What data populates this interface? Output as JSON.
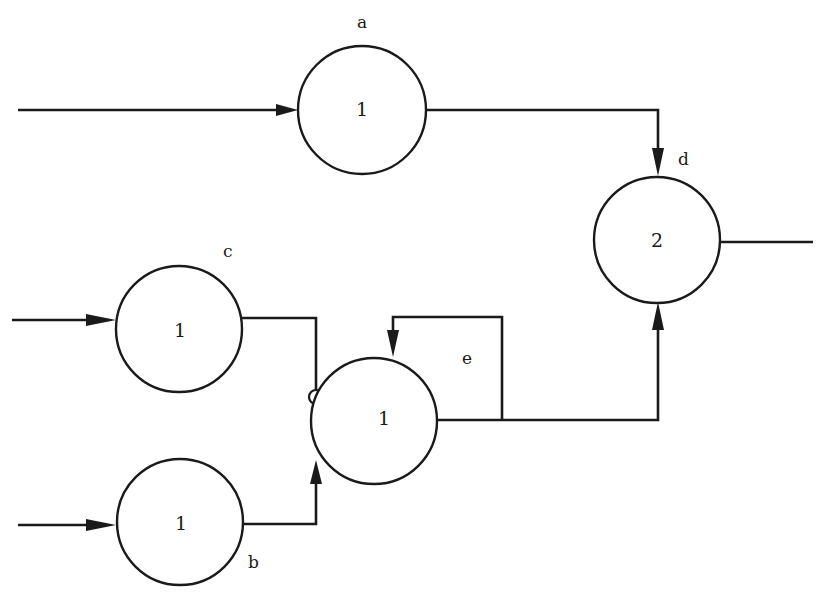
{
  "diagram": {
    "type": "threshold-neuron-network",
    "colors": {
      "line": "#1a1a1a",
      "background": "#ffffff"
    },
    "nodes": [
      {
        "id": "a",
        "label": "a",
        "threshold": "1"
      },
      {
        "id": "c",
        "label": "c",
        "threshold": "1"
      },
      {
        "id": "b",
        "label": "b",
        "threshold": "1"
      },
      {
        "id": "e",
        "label": "e",
        "threshold": "1"
      },
      {
        "id": "d",
        "label": "d",
        "threshold": "2"
      }
    ],
    "edges": [
      {
        "from": "input",
        "to": "a",
        "type": "excitatory"
      },
      {
        "from": "input",
        "to": "c",
        "type": "excitatory"
      },
      {
        "from": "input",
        "to": "b",
        "type": "excitatory"
      },
      {
        "from": "c",
        "to": "e",
        "type": "inhibitory"
      },
      {
        "from": "b",
        "to": "e",
        "type": "excitatory"
      },
      {
        "from": "e",
        "to": "e",
        "type": "excitatory",
        "note": "feedback loop"
      },
      {
        "from": "a",
        "to": "d",
        "type": "excitatory"
      },
      {
        "from": "e",
        "to": "d",
        "type": "excitatory"
      },
      {
        "from": "d",
        "to": "output",
        "type": "output"
      }
    ]
  }
}
